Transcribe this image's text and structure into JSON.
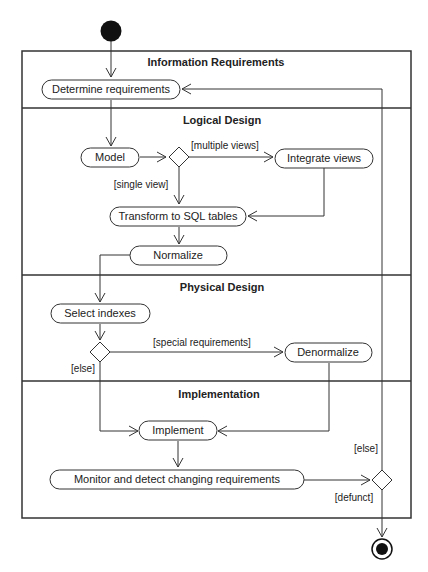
{
  "diagram": {
    "type": "uml-activity-diagram",
    "lanes": [
      {
        "title": "Information Requirements"
      },
      {
        "title": "Logical Design"
      },
      {
        "title": "Physical Design"
      },
      {
        "title": "Implementation"
      }
    ],
    "activities": {
      "determine": "Determine requirements",
      "model": "Model",
      "integrate": "Integrate views",
      "transform": "Transform to SQL tables",
      "normalize": "Normalize",
      "select_indexes": "Select indexes",
      "denormalize": "Denormalize",
      "implement": "Implement",
      "monitor": "Monitor and detect changing requirements"
    },
    "guards": {
      "multiple_views": "[multiple views]",
      "single_view": "[single view]",
      "special_requirements": "[special requirements]",
      "else_physical": "[else]",
      "else_loop": "[else]",
      "defunct": "[defunct]"
    },
    "colors": {
      "line": "#333333",
      "fill": "#ffffff",
      "node": "#111111"
    }
  }
}
